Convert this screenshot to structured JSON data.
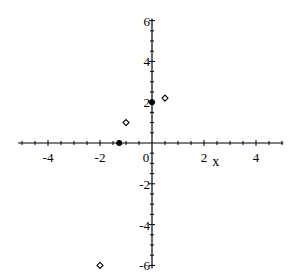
{
  "chart_data": {
    "type": "scatter",
    "title": "",
    "xlabel": "x",
    "ylabel": "",
    "xlim": [
      -5.15,
      5.05
    ],
    "ylim": [
      -6.15,
      6.1
    ],
    "grid": false,
    "x_ticks": [
      -4,
      -2,
      0,
      2,
      4
    ],
    "x_tick_labels": [
      "-4",
      "-2",
      "0",
      "2",
      "4"
    ],
    "y_ticks": [
      -6,
      -4,
      -2,
      2,
      4,
      6
    ],
    "y_tick_labels": [
      "-6",
      "-4",
      "-2",
      "2",
      "4",
      "6"
    ],
    "minor_tick_step_x": 0.5,
    "minor_tick_step_y": 0.5,
    "series": [
      {
        "name": "open-points",
        "marker": "diamond-open",
        "points": [
          {
            "x": -1,
            "y": 1
          },
          {
            "x": 0.5,
            "y": 2.2
          },
          {
            "x": -2,
            "y": -6
          }
        ]
      },
      {
        "name": "filled-points",
        "marker": "circle-filled",
        "points": [
          {
            "x": 0,
            "y": 2
          },
          {
            "x": -1.26,
            "y": 0
          }
        ]
      }
    ]
  }
}
